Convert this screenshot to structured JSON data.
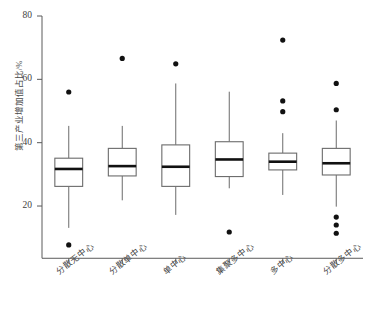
{
  "chart": {
    "title": "",
    "ylabel": "第三产业增加值占比/%",
    "xlabel": "",
    "y_ticks": [
      "20",
      "40",
      "60",
      "80"
    ],
    "x_categories": [
      "分散无中心",
      "分散单中心",
      "单中心",
      "集聚多中心",
      "多中心",
      "分散多中心"
    ],
    "colors": {
      "box_stroke": "#6b6b6b",
      "median": "#111111",
      "outlier": "#111111",
      "axis": "#5a5a5a",
      "background": "#ffffff"
    }
  },
  "chart_data": {
    "type": "box",
    "title": "",
    "xlabel": "",
    "ylabel": "第三产业增加值占比/%",
    "ylim": [
      5,
      80
    ],
    "yticks": [
      20,
      40,
      60,
      80
    ],
    "grid": false,
    "legend": "none",
    "categories": [
      "分散无中心",
      "分散单中心",
      "单中心",
      "集聚多中心",
      "多中心",
      "分散多中心"
    ],
    "boxes": [
      {
        "category": "分散无中心",
        "whisker_low": 13.1,
        "q1": 26.2,
        "median": 31.7,
        "q3": 35.1,
        "whisker_high": 45.3,
        "outliers": [
          56.0,
          7.7
        ]
      },
      {
        "category": "分散单中心",
        "whisker_low": 21.8,
        "q1": 29.5,
        "median": 32.6,
        "q3": 38.2,
        "whisker_high": 45.3,
        "outliers": [
          66.6
        ]
      },
      {
        "category": "单中心",
        "whisker_low": 17.2,
        "q1": 26.2,
        "median": 32.4,
        "q3": 39.3,
        "whisker_high": 58.7,
        "outliers": [
          64.9
        ]
      },
      {
        "category": "集聚多中心",
        "whisker_low": 25.6,
        "q1": 29.3,
        "median": 34.7,
        "q3": 40.3,
        "whisker_high": 56.1,
        "outliers": [
          11.8
        ]
      },
      {
        "category": "多中心",
        "whisker_low": 23.5,
        "q1": 31.4,
        "median": 34.0,
        "q3": 36.7,
        "whisker_high": 43.0,
        "outliers": [
          72.4,
          53.2,
          49.8
        ]
      },
      {
        "category": "分散多中心",
        "whisker_low": 19.8,
        "q1": 29.8,
        "median": 33.5,
        "q3": 38.2,
        "whisker_high": 47.0,
        "outliers": [
          58.7,
          50.4,
          16.5,
          14.0,
          11.4
        ]
      }
    ]
  }
}
